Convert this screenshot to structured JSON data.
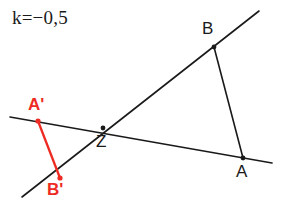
{
  "figure": {
    "title_formula": "k=−0,5",
    "width": 286,
    "height": 224,
    "background": "#ffffff",
    "colors": {
      "line": "#1a1a1a",
      "image_segment": "#EE2B22",
      "label_black": "#1a1a1a",
      "label_red": "#EE2B22"
    },
    "scale_factor": -0.5,
    "type": "geometric-dilation"
  },
  "labels": {
    "A": "A",
    "B": "B",
    "Z": "Z",
    "A_prime": "A'",
    "B_prime": "B'"
  },
  "points": {
    "A": {
      "x": 243,
      "y": 158,
      "label": "A"
    },
    "B": {
      "x": 214,
      "y": 47,
      "label": "B"
    },
    "Z": {
      "x": 103,
      "y": 128,
      "label": "Z"
    },
    "A_prime": {
      "x": 38,
      "y": 121,
      "label": "A'"
    },
    "B_prime": {
      "x": 60,
      "y": 178,
      "label": "B'"
    }
  },
  "segments": [
    {
      "name": "segment-AB",
      "from": "B",
      "to": "A",
      "color": "#1a1a1a",
      "width": 1.6,
      "x1": 214,
      "y1": 47,
      "x2": 243,
      "y2": 158
    },
    {
      "name": "segment-A-prime-B-prime",
      "from": "A_prime",
      "to": "B_prime",
      "color": "#EE2B22",
      "width": 2.3,
      "x1": 38,
      "y1": 121,
      "x2": 60,
      "y2": 178
    }
  ],
  "rays": [
    {
      "name": "ray-through-A-Z-A-prime",
      "color": "#1a1a1a",
      "width": 1.6,
      "x1": 10,
      "y1": 117,
      "x2": 272,
      "y2": 163
    },
    {
      "name": "ray-through-B-Z-B-prime",
      "color": "#1a1a1a",
      "width": 1.6,
      "x1": 22,
      "y1": 197,
      "x2": 259,
      "y2": 11
    }
  ],
  "dots": [
    {
      "name": "dot-A",
      "x": 243,
      "y": 158,
      "r": 2.4,
      "color": "#1a1a1a"
    },
    {
      "name": "dot-B",
      "x": 214,
      "y": 47,
      "r": 2.4,
      "color": "#1a1a1a"
    },
    {
      "name": "dot-Z",
      "x": 103,
      "y": 128,
      "r": 2.4,
      "color": "#1a1a1a"
    },
    {
      "name": "dot-A-prime",
      "x": 38,
      "y": 121,
      "r": 2.6,
      "color": "#EE2B22"
    },
    {
      "name": "dot-B-prime",
      "x": 60,
      "y": 178,
      "r": 2.6,
      "color": "#EE2B22"
    }
  ]
}
